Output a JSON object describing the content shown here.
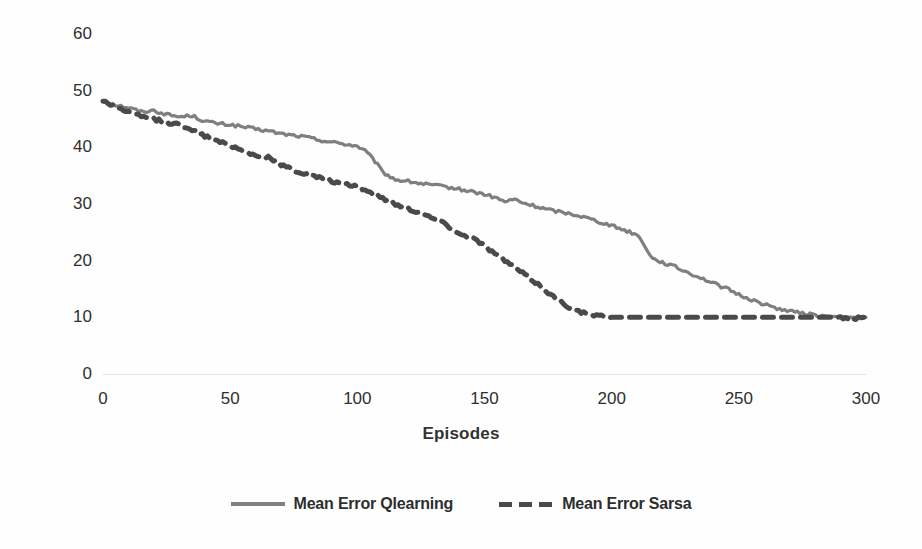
{
  "chart_data": {
    "type": "line",
    "title": "",
    "xlabel": "Episodes",
    "ylabel": "Mean Error per episode",
    "xlim": [
      0,
      300
    ],
    "ylim": [
      0,
      60
    ],
    "xticks": [
      0,
      50,
      100,
      150,
      200,
      250,
      300
    ],
    "yticks": [
      0,
      10,
      20,
      30,
      40,
      50,
      60
    ],
    "grid": false,
    "legend_position": "bottom-center",
    "colors": {
      "qlearning": "#7f7f7f",
      "sarsa": "#4a4a4a",
      "axis_text": "#2f2f2f",
      "gridline": "#e3e3e3",
      "background": "#fefefe"
    },
    "series": [
      {
        "name": "Mean Error Qlearning",
        "style": "solid",
        "color": "#7f7f7f",
        "x": [
          0,
          5,
          10,
          15,
          20,
          25,
          30,
          35,
          40,
          45,
          50,
          55,
          60,
          65,
          70,
          75,
          80,
          85,
          90,
          95,
          100,
          103,
          107,
          110,
          115,
          120,
          125,
          130,
          135,
          140,
          145,
          150,
          155,
          158,
          162,
          165,
          170,
          175,
          180,
          185,
          190,
          195,
          200,
          205,
          210,
          213,
          216,
          220,
          225,
          230,
          235,
          240,
          245,
          250,
          255,
          260,
          265,
          270,
          275,
          280,
          285,
          290,
          295,
          300
        ],
        "values": [
          48.2,
          47.5,
          47.0,
          46.3,
          46.5,
          45.8,
          45.4,
          45.6,
          44.6,
          44.2,
          44.0,
          43.6,
          43.2,
          42.9,
          42.4,
          42.1,
          41.8,
          41.3,
          40.9,
          40.6,
          40.2,
          39.4,
          37.5,
          35.6,
          34.3,
          34.0,
          33.6,
          33.3,
          33.0,
          32.6,
          32.2,
          31.7,
          31.0,
          30.4,
          30.8,
          30.2,
          29.6,
          29.0,
          28.6,
          28.2,
          27.6,
          26.9,
          26.2,
          25.4,
          24.6,
          22.7,
          20.4,
          19.7,
          18.9,
          17.9,
          17.0,
          16.0,
          15.1,
          14.0,
          13.1,
          12.3,
          11.6,
          11.1,
          10.7,
          10.4,
          10.2,
          10.1,
          10.0,
          10.0
        ]
      },
      {
        "name": "Mean Error Sarsa",
        "style": "dashed",
        "color": "#4a4a4a",
        "x": [
          0,
          5,
          10,
          15,
          20,
          25,
          30,
          35,
          40,
          45,
          50,
          55,
          60,
          65,
          70,
          75,
          80,
          85,
          90,
          95,
          100,
          105,
          110,
          115,
          120,
          125,
          130,
          135,
          140,
          145,
          150,
          155,
          160,
          165,
          170,
          175,
          180,
          185,
          190,
          195,
          200,
          210,
          220,
          230,
          240,
          250,
          260,
          270,
          280,
          290,
          300
        ],
        "values": [
          48.2,
          47.2,
          46.2,
          45.4,
          45.0,
          44.4,
          44.0,
          43.2,
          42.0,
          41.0,
          40.4,
          39.4,
          38.6,
          38.2,
          37.0,
          36.0,
          35.2,
          34.6,
          34.0,
          33.4,
          33.2,
          32.0,
          31.0,
          30.0,
          29.2,
          28.4,
          27.4,
          26.4,
          24.7,
          24.2,
          22.6,
          21.0,
          19.4,
          17.8,
          16.2,
          14.4,
          12.7,
          11.4,
          10.6,
          10.2,
          10.0,
          10.0,
          10.0,
          10.0,
          10.0,
          10.0,
          10.0,
          10.0,
          10.0,
          10.0,
          9.8
        ]
      }
    ],
    "legend": [
      {
        "label": "Mean Error Qlearning",
        "style": "solid",
        "color": "#7f7f7f"
      },
      {
        "label": "Mean Error Sarsa",
        "style": "dashed",
        "color": "#4a4a4a"
      }
    ]
  }
}
